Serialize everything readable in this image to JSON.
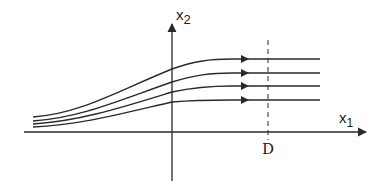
{
  "diagram": {
    "type": "streamlines",
    "axes": {
      "vertical_label": "x",
      "vertical_sub": "2",
      "horizontal_label": "x",
      "horizontal_sub": "1"
    },
    "marker": {
      "label": "D",
      "style": "dashed vertical line"
    },
    "streamlines": [
      {
        "name": "line-1",
        "left_y": 117,
        "axis_y": 69,
        "right_y": 59
      },
      {
        "name": "line-2",
        "left_y": 121,
        "axis_y": 82,
        "right_y": 73
      },
      {
        "name": "line-3",
        "left_y": 124,
        "axis_y": 92,
        "right_y": 86
      },
      {
        "name": "line-4",
        "left_y": 127,
        "axis_y": 102,
        "right_y": 100
      }
    ],
    "colors": {
      "ink": "#2a2a2a",
      "background": "#ffffff"
    }
  }
}
